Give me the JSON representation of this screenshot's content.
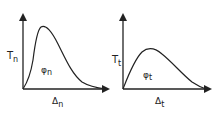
{
  "diagram": {
    "type": "traction-separation-curves",
    "panels": [
      {
        "id": "normal",
        "y_label": "T",
        "y_sub": "n",
        "x_label": "Δ",
        "x_sub": "n",
        "area_label": "φ",
        "area_sub": "n"
      },
      {
        "id": "tangential",
        "y_label": "T",
        "y_sub": "t",
        "x_label": "Δ",
        "x_sub": "t",
        "area_label": "φ",
        "area_sub": "t"
      }
    ],
    "colors": {
      "line": "#222222",
      "background": "#ffffff"
    }
  }
}
